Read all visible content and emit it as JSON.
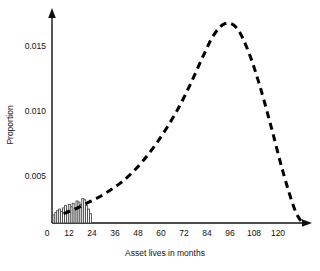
{
  "chart_data": {
    "type": "bar",
    "title": "",
    "subtitle": "",
    "xlabel": "Asset lives in months",
    "ylabel": "Proportion",
    "xlim": [
      0,
      132
    ],
    "ylim": [
      0,
      0.0185
    ],
    "grid": false,
    "legend": "none",
    "x_ticks": [
      "0",
      "12",
      "24",
      "36",
      "48",
      "60",
      "72",
      "84",
      "96",
      "108",
      "120"
    ],
    "x_tick_values": [
      0,
      12,
      24,
      36,
      48,
      60,
      72,
      84,
      96,
      108,
      120
    ],
    "y_ticks": [
      "0.005",
      "0.010",
      "0.015"
    ],
    "y_tick_values": [
      0.005,
      0.01,
      0.015
    ],
    "categories": [
      1,
      2,
      3,
      4,
      5,
      6,
      7,
      8,
      9,
      10,
      11,
      12,
      13,
      14,
      15,
      16,
      17,
      18,
      19,
      20
    ],
    "values": [
      0.0007,
      0.0009,
      0.0011,
      0.0012,
      0.001,
      0.0013,
      0.0015,
      0.0011,
      0.0016,
      0.0014,
      0.0017,
      0.0013,
      0.0019,
      0.0018,
      0.0016,
      0.0021,
      0.002,
      0.0015,
      0.0012,
      0.0008
    ],
    "series": [
      {
        "name": "fitted-distribution-curve",
        "type": "line",
        "style": "dashed",
        "x": [
          6,
          12,
          18,
          24,
          30,
          36,
          42,
          48,
          54,
          60,
          66,
          72,
          78,
          84,
          90,
          96,
          102,
          108,
          114,
          120,
          126,
          130
        ],
        "y": [
          0.0008,
          0.0012,
          0.0017,
          0.0022,
          0.0028,
          0.0035,
          0.0044,
          0.0055,
          0.0068,
          0.0083,
          0.01,
          0.012,
          0.0142,
          0.0162,
          0.0172,
          0.0168,
          0.0148,
          0.0118,
          0.0082,
          0.0044,
          0.0012,
          0.0
        ]
      }
    ],
    "annotations": {
      "peak_x": 90,
      "peak_y": 0.0172
    }
  },
  "axes": {
    "y_label": "Proportion",
    "x_label": "Asset lives in months",
    "origin_label": "0"
  }
}
